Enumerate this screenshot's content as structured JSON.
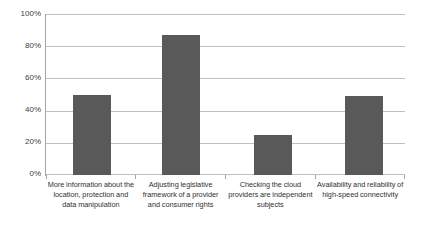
{
  "chart_data": {
    "type": "bar",
    "title": "",
    "subtitle": "",
    "xlabel": "",
    "ylabel": "",
    "ylim": [
      0,
      100
    ],
    "yticks": [
      "0%",
      "20%",
      "40%",
      "60%",
      "80%",
      "100%"
    ],
    "ytick_values": [
      0,
      20,
      40,
      60,
      80,
      100
    ],
    "grid": true,
    "legend": false,
    "legend_position": "none",
    "bar_color": "#595959",
    "gridline_color": "#bfbfbf",
    "axis_color": "#a6a6a6",
    "background_color": "#ffffff",
    "categories": [
      "More information about the location, protection and data manipulation",
      "Adjusting legislative framework of a provider and consumer rights",
      "Checking the cloud providers are independent subjects",
      "Availability and reliability of high-speed connectivity"
    ],
    "values": [
      50,
      87,
      25,
      49
    ],
    "series": [
      {
        "name": "",
        "values": [
          50,
          87,
          25,
          49
        ]
      }
    ]
  },
  "axis": {
    "y_tick_0": "0%",
    "y_tick_1": "20%",
    "y_tick_2": "40%",
    "y_tick_3": "60%",
    "y_tick_4": "80%",
    "y_tick_5": "100%"
  },
  "categories": {
    "cat_0": "More information about the location, protection and data manipulation",
    "cat_1": "Adjusting legislative framework of a provider and consumer rights",
    "cat_2": "Checking the cloud providers are independent subjects",
    "cat_3": "Availability and reliability of high-speed connectivity"
  }
}
